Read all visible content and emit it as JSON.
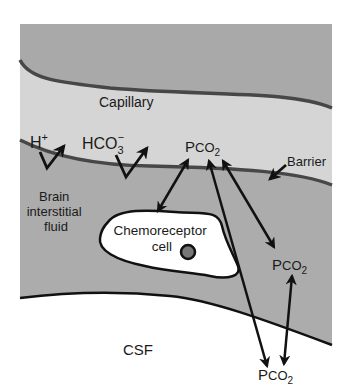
{
  "diagram": {
    "regions": {
      "capillary": {
        "label": "Capillary",
        "fill": "#d4d4d4"
      },
      "blood_top": {
        "fill": "#a9a9a9"
      },
      "brain_interstitial_fluid": {
        "label_lines": [
          "Brain",
          "interstitial",
          "fluid"
        ],
        "fill": "#ababab"
      },
      "csf": {
        "label": "CSF",
        "fill": "#ffffff"
      }
    },
    "cell": {
      "label_lines": [
        "Chemoreceptor",
        "cell"
      ],
      "fill": "#ffffff",
      "nucleus_fill": "#777777"
    },
    "ions": {
      "h_plus": {
        "base": "H",
        "sup": "+"
      },
      "bicarbonate": {
        "base": "HCO",
        "sub": "3",
        "sup": "−"
      }
    },
    "pco2": {
      "capillary": {
        "base": "P",
        "small": "CO",
        "sub": "2"
      },
      "interstitial": {
        "base": "P",
        "small": "CO",
        "sub": "2"
      },
      "csf": {
        "base": "P",
        "small": "CO",
        "sub": "2"
      }
    },
    "barrier_label": "Barrier",
    "colors": {
      "membrane": "#4a4a4a",
      "outline": "#111111",
      "arrow": "#111111"
    }
  }
}
